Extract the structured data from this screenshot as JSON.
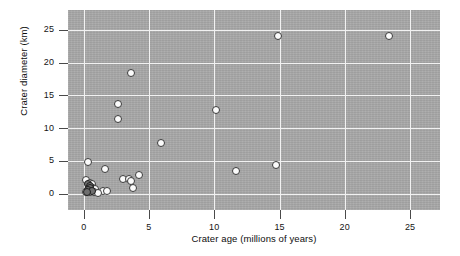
{
  "chart_data": {
    "type": "scatter",
    "title": "",
    "xlabel": "Crater age (millions of years)",
    "ylabel": "Crater diameter (km)",
    "xlim": [
      -1.2,
      27.3
    ],
    "ylim": [
      -2.5,
      28.0
    ],
    "xticks": [
      0,
      5,
      10,
      15,
      20,
      25
    ],
    "yticks": [
      0,
      5,
      10,
      15,
      20,
      25
    ],
    "xtick_labels": [
      "0",
      "5",
      "10",
      "15",
      "20",
      "25"
    ],
    "ytick_labels": [
      "0",
      "5",
      "10",
      "15",
      "20",
      "25"
    ],
    "grid": true,
    "legend": "none",
    "marker": "open-circle",
    "panel_color": "#a8a8a8",
    "grid_color": "#f2f2f2",
    "marker_face_color": "#fbfbfb",
    "marker_edge_color": "#3a3a3a",
    "points": [
      {
        "x": 14.9,
        "y": 24.1
      },
      {
        "x": 23.4,
        "y": 24.0
      },
      {
        "x": 3.6,
        "y": 18.4
      },
      {
        "x": 2.6,
        "y": 13.7
      },
      {
        "x": 2.6,
        "y": 11.4
      },
      {
        "x": 10.1,
        "y": 12.7
      },
      {
        "x": 5.9,
        "y": 7.8
      },
      {
        "x": 0.3,
        "y": 4.9
      },
      {
        "x": 1.6,
        "y": 3.8
      },
      {
        "x": 3.0,
        "y": 2.2
      },
      {
        "x": 3.5,
        "y": 2.3
      },
      {
        "x": 3.6,
        "y": 1.9
      },
      {
        "x": 4.2,
        "y": 2.9
      },
      {
        "x": 3.8,
        "y": 0.9
      },
      {
        "x": 1.5,
        "y": 0.4
      },
      {
        "x": 1.8,
        "y": 0.4
      },
      {
        "x": 11.7,
        "y": 3.5
      },
      {
        "x": 14.7,
        "y": 4.4
      },
      {
        "x": 0.2,
        "y": 2.1
      },
      {
        "x": 0.5,
        "y": 1.7
      },
      {
        "x": 0.6,
        "y": 1.4
      },
      {
        "x": 0.4,
        "y": 1.1
      },
      {
        "x": 0.7,
        "y": 0.9
      },
      {
        "x": 0.9,
        "y": 0.7
      },
      {
        "x": 0.3,
        "y": 0.6
      },
      {
        "x": 0.5,
        "y": 0.3
      },
      {
        "x": 0.2,
        "y": 0.2
      },
      {
        "x": 0.8,
        "y": 0.2
      },
      {
        "x": 1.1,
        "y": 0.1
      }
    ],
    "dark_points": [
      {
        "x": 0.35,
        "y": 1.5
      },
      {
        "x": 0.5,
        "y": 1.2
      },
      {
        "x": 0.45,
        "y": 0.8
      },
      {
        "x": 0.3,
        "y": 0.5
      },
      {
        "x": 0.6,
        "y": 0.4
      },
      {
        "x": 0.25,
        "y": 0.25
      }
    ]
  }
}
